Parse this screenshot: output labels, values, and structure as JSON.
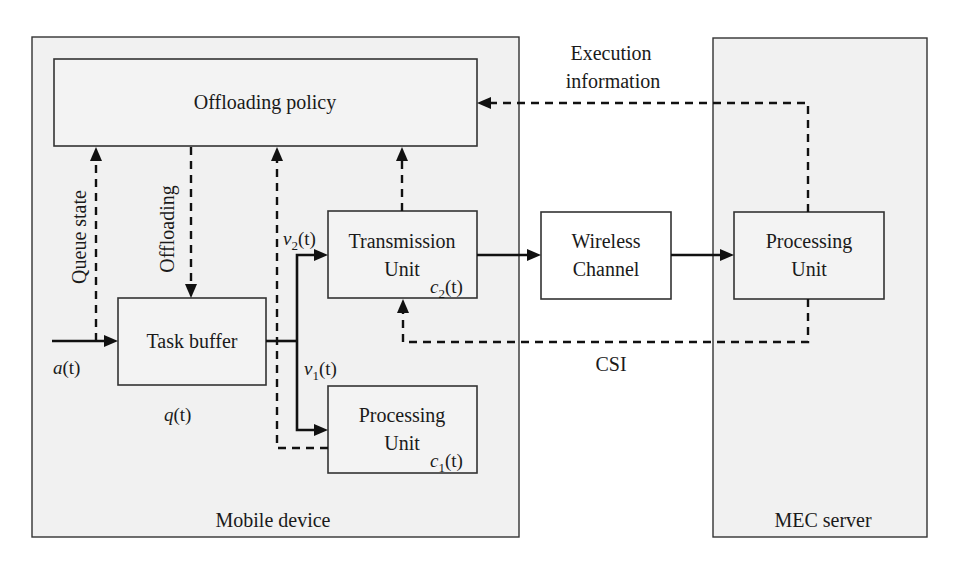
{
  "diagram": {
    "regions": {
      "mobile_device": "Mobile device",
      "mec_server": "MEC server"
    },
    "blocks": {
      "offloading_policy": "Offloading policy",
      "task_buffer": "Task buffer",
      "transmission_unit": [
        "Transmission",
        "Unit"
      ],
      "local_processing_unit": [
        "Processing",
        "Unit"
      ],
      "wireless_channel": [
        "Wireless",
        "Channel"
      ],
      "mec_processing_unit": [
        "Processing",
        "Unit"
      ]
    },
    "signals": {
      "queue_state": "Queue state",
      "offloading": "Offloading",
      "execution_information": [
        "Execution",
        "information"
      ],
      "csi": "CSI"
    },
    "variables": {
      "arrival": {
        "base": "a",
        "sub": "",
        "arg": "(t)"
      },
      "queue": {
        "base": "q",
        "sub": "",
        "arg": "(t)"
      },
      "v1": {
        "base": "v",
        "sub": "1",
        "arg": "(t)"
      },
      "v2": {
        "base": "v",
        "sub": "2",
        "arg": "(t)"
      },
      "c1": {
        "base": "c",
        "sub": "1",
        "arg": "(t)"
      },
      "c2": {
        "base": "c",
        "sub": "2",
        "arg": "(t)"
      }
    },
    "colors": {
      "region_fill": "#f1f1f1",
      "line": "#111111",
      "background": "#ffffff"
    }
  }
}
